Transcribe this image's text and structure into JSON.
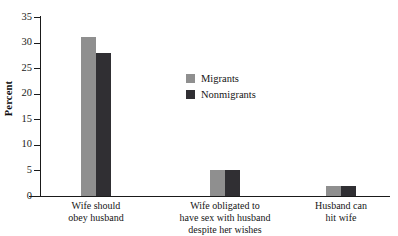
{
  "chart_data": {
    "type": "bar",
    "title": "",
    "subtitle": "",
    "xlabel": "",
    "ylabel": "Percent",
    "ylim": [
      0,
      35
    ],
    "yticks": [
      0,
      5,
      10,
      15,
      20,
      25,
      30,
      35
    ],
    "ytick_labels": [
      "0",
      "5",
      "10",
      "15",
      "20",
      "25",
      "30",
      "35"
    ],
    "grid": false,
    "legend_position": "upper-center",
    "categories": [
      "Wife should obey husband",
      "Wife obligated to have sex with husband despite her wishes",
      "Husband can hit wife"
    ],
    "category_lines": [
      [
        "Wife should",
        "obey husband"
      ],
      [
        "Wife obligated to",
        "have sex with husband",
        "despite her wishes"
      ],
      [
        "Husband can",
        "hit wife"
      ]
    ],
    "series": [
      {
        "name": "Migrants",
        "color": "#8f8f8f",
        "values": [
          31,
          5,
          2
        ]
      },
      {
        "name": "Nonmigrants",
        "color": "#302f33",
        "values": [
          28,
          5,
          2
        ]
      }
    ]
  },
  "legend": {
    "items": [
      {
        "label": "Migrants",
        "color": "#8f8f8f"
      },
      {
        "label": "Nonmigrants",
        "color": "#302f33"
      }
    ]
  },
  "axes": {
    "y_title": "Percent"
  }
}
